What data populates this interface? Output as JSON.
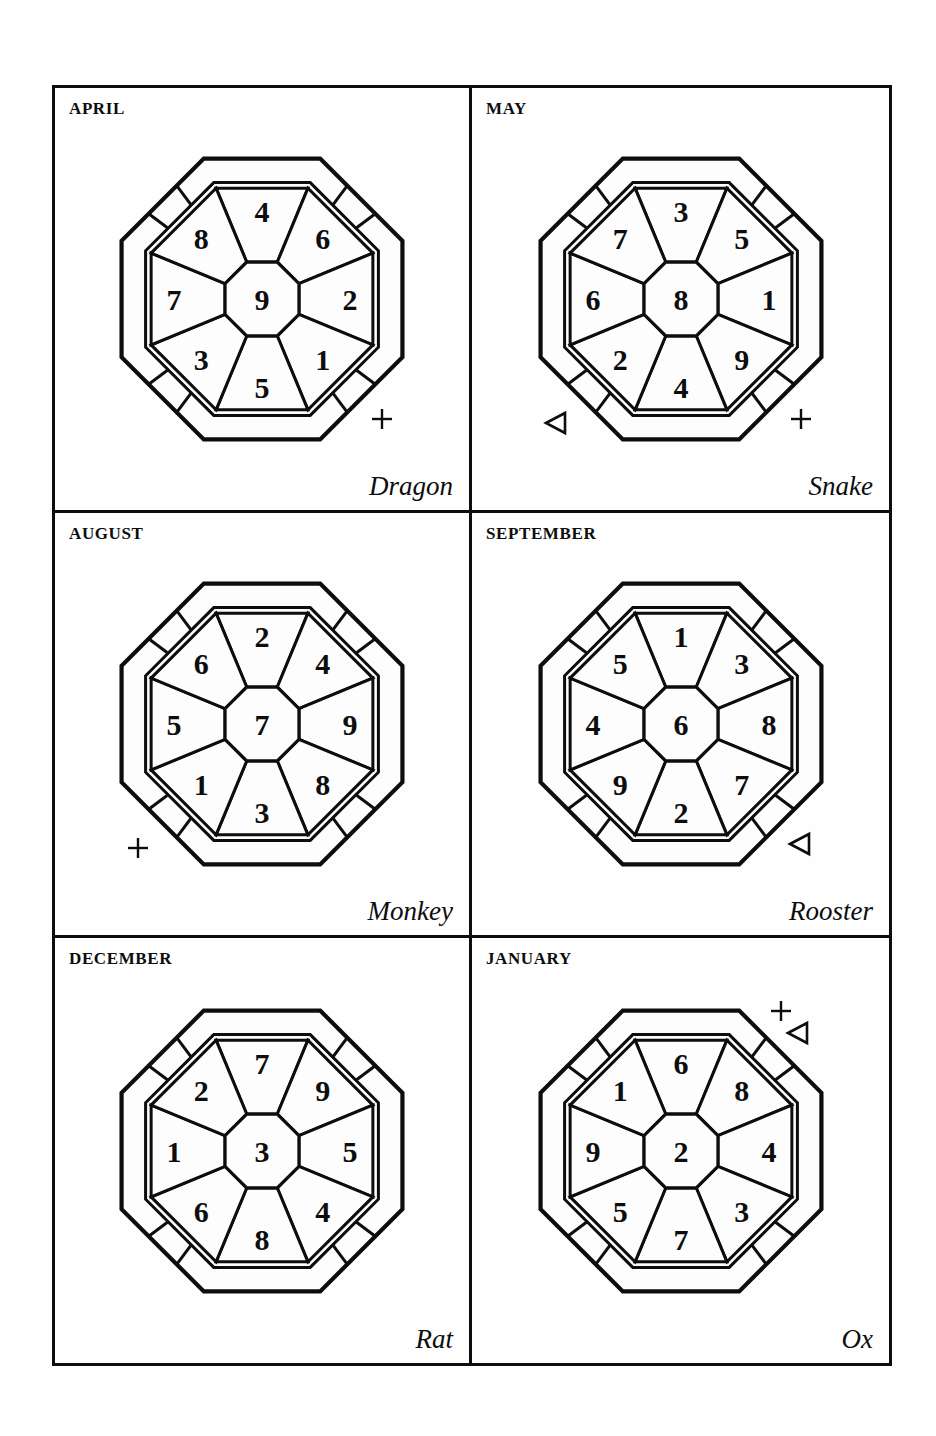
{
  "page": {
    "panel_count": 6
  },
  "legend": {
    "marker_glyphs": {
      "triangle-up": "△",
      "triangle-left": "◁",
      "triangle-right": "▷",
      "plus": "+",
      "cross": "×"
    }
  },
  "colors": {
    "ink": "#0d0d0d",
    "paper": "#fefefe",
    "cell_fill": "#fdfdfd"
  },
  "panels": [
    {
      "id": "april-dragon",
      "month": "APRIL",
      "animal": "Dragon",
      "center": "9",
      "sectors": {
        "N": "4",
        "NE": "6",
        "E": "2",
        "SE": "1",
        "S": "5",
        "SW": "3",
        "W": "7",
        "NW": "8"
      },
      "markers": [
        {
          "name": "triangle-up-marker",
          "glyph": "triangle-up",
          "position": "N"
        },
        {
          "name": "plus-marker",
          "glyph": "plus",
          "position": "SE"
        }
      ]
    },
    {
      "id": "may-snake",
      "month": "MAY",
      "animal": "Snake",
      "center": "8",
      "sectors": {
        "N": "3",
        "NE": "5",
        "E": "1",
        "SE": "9",
        "S": "4",
        "SW": "2",
        "W": "6",
        "NW": "7"
      },
      "markers": [
        {
          "name": "triangle-left-marker",
          "glyph": "triangle-left",
          "position": "SW"
        },
        {
          "name": "plus-marker",
          "glyph": "plus",
          "position": "SE"
        }
      ]
    },
    {
      "id": "august-monkey",
      "month": "AUGUST",
      "animal": "Monkey",
      "center": "7",
      "sectors": {
        "N": "2",
        "NE": "4",
        "E": "9",
        "SE": "8",
        "S": "3",
        "SW": "1",
        "W": "5",
        "NW": "6"
      },
      "markers": [
        {
          "name": "triangle-right-marker",
          "glyph": "triangle-right",
          "position": "E"
        },
        {
          "name": "plus-marker",
          "glyph": "plus",
          "position": "SW"
        }
      ]
    },
    {
      "id": "september-rooster",
      "month": "SEPTEMBER",
      "animal": "Rooster",
      "center": "6",
      "sectors": {
        "N": "1",
        "NE": "3",
        "E": "8",
        "SE": "7",
        "S": "2",
        "SW": "9",
        "W": "4",
        "NW": "5"
      },
      "markers": [
        {
          "name": "cross-marker",
          "glyph": "cross",
          "position": "W"
        },
        {
          "name": "triangle-left-marker",
          "glyph": "triangle-left",
          "position": "SE"
        }
      ]
    },
    {
      "id": "december-rat",
      "month": "DECEMBER",
      "animal": "Rat",
      "center": "3",
      "sectors": {
        "N": "7",
        "NE": "9",
        "E": "5",
        "SE": "4",
        "S": "8",
        "SW": "6",
        "W": "1",
        "NW": "2"
      },
      "markers": [
        {
          "name": "cross-marker",
          "glyph": "cross",
          "position": "N"
        },
        {
          "name": "triangle-left-marker",
          "glyph": "triangle-left",
          "position": "W"
        }
      ]
    },
    {
      "id": "january-ox",
      "month": "JANUARY",
      "animal": "Ox",
      "center": "2",
      "sectors": {
        "N": "6",
        "NE": "8",
        "E": "4",
        "SE": "3",
        "S": "7",
        "SW": "5",
        "W": "9",
        "NW": "1"
      },
      "markers": [
        {
          "name": "plus-marker",
          "glyph": "plus",
          "position": "NE-upper"
        },
        {
          "name": "triangle-left-marker",
          "glyph": "triangle-left",
          "position": "NE"
        }
      ]
    }
  ]
}
